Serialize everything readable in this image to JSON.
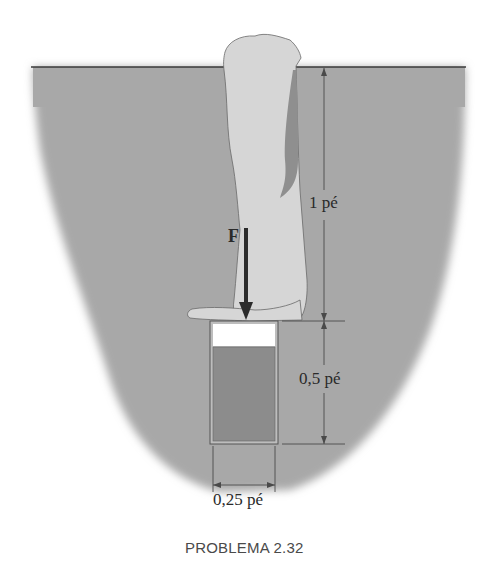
{
  "figure": {
    "caption": "PROBLEMA 2.32",
    "force_label": "F",
    "dimensions": {
      "arm_depth": "1 pé",
      "container_height": "0,5 pé",
      "container_width": "0,25 pé"
    },
    "colors": {
      "water": "#a8a8a8",
      "surface_line": "#3a3a3a",
      "arm_fill": "#d6d6d6",
      "arm_shadow": "#8f8f8f",
      "container_fluid": "#8c8c8c",
      "container_air": "#ffffff",
      "force_arrow": "#2b2b2b",
      "dimension_lines": "#4a4a4a"
    }
  }
}
